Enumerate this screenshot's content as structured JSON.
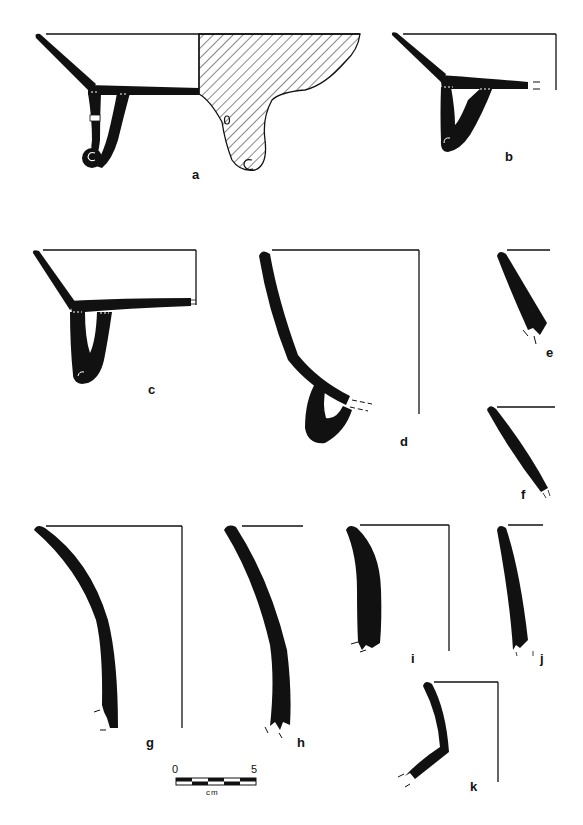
{
  "figure": {
    "type": "pottery-profile-plate",
    "ink_color": "#111111",
    "background": "#ffffff",
    "profiles": [
      {
        "id": "a",
        "label": "a",
        "description": "bowl with looped scroll foot, half section hatched"
      },
      {
        "id": "b",
        "label": "b",
        "description": "bowl with scroll foot, base broken"
      },
      {
        "id": "c",
        "label": "c",
        "description": "bowl with scroll foot"
      },
      {
        "id": "d",
        "label": "d",
        "description": "deep vessel with loop foot"
      },
      {
        "id": "e",
        "label": "e",
        "description": "rim sherd"
      },
      {
        "id": "f",
        "label": "f",
        "description": "rim sherd"
      },
      {
        "id": "g",
        "label": "g",
        "description": "flaring rim/body sherd"
      },
      {
        "id": "h",
        "label": "h",
        "description": "flaring rim/body sherd"
      },
      {
        "id": "i",
        "label": "i",
        "description": "rim sherd"
      },
      {
        "id": "j",
        "label": "j",
        "description": "rim sherd"
      },
      {
        "id": "k",
        "label": "k",
        "description": "carinated sherd"
      }
    ],
    "scale_bar": {
      "start_label": "0",
      "end_label": "5",
      "unit": "cm"
    }
  }
}
